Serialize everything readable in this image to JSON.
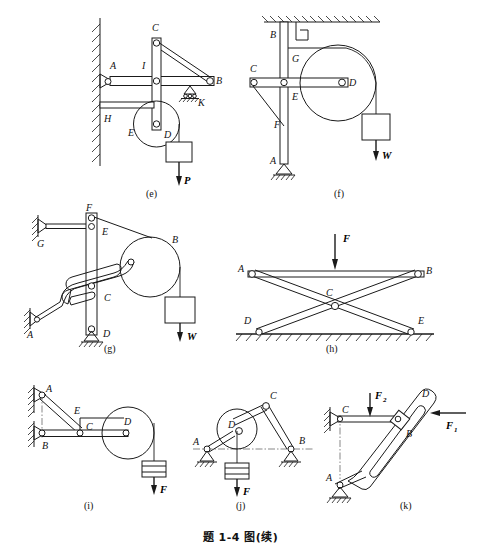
{
  "plate": {
    "caption": "题 1-4 图(续)",
    "figure_count": 7,
    "type": "engineering-mechanics-linkage-diagrams"
  },
  "subfigures": [
    {
      "id": "e",
      "label": "(e)",
      "description": "Wall-mounted bracket with pulley and hanging weight",
      "points": [
        "A",
        "B",
        "C",
        "D",
        "E",
        "H",
        "I",
        "K"
      ],
      "forces": [
        "P"
      ],
      "supports": [
        "wall-hatched",
        "roller-support"
      ],
      "point_labels": {
        "A": "A",
        "B": "B",
        "C": "C",
        "D": "D",
        "E": "E",
        "H": "H",
        "I": "I",
        "K": "K"
      },
      "force_labels": {
        "P": "P"
      }
    },
    {
      "id": "f",
      "label": "(f)",
      "description": "Ceiling-anchored vertical column with horizontal arm, drum pulley and weight",
      "points": [
        "A",
        "B",
        "C",
        "D",
        "E",
        "F",
        "G"
      ],
      "forces": [
        "W"
      ],
      "supports": [
        "ceiling-hatched",
        "pin-support-ground"
      ],
      "point_labels": {
        "A": "A",
        "B": "B",
        "C": "C",
        "D": "D",
        "E": "E",
        "F": "F",
        "G": "G"
      },
      "force_labels": {
        "W": "W"
      }
    },
    {
      "id": "g",
      "label": "(g)",
      "description": "Vertical link with slotted bar, pulley and hanging weight",
      "points": [
        "A",
        "B",
        "C",
        "D",
        "E",
        "F",
        "G"
      ],
      "forces": [
        "W"
      ],
      "supports": [
        "wall-hatched-G",
        "wall-hatched-A",
        "pin-support-ground-D"
      ],
      "point_labels": {
        "A": "A",
        "B": "B",
        "C": "C",
        "D": "D",
        "E": "E",
        "F": "F",
        "G": "G"
      },
      "force_labels": {
        "W": "W"
      }
    },
    {
      "id": "h",
      "label": "(h)",
      "description": "Scissor (X-shaped) linkage on ground with vertical load on top bar",
      "points": [
        "A",
        "B",
        "C",
        "D",
        "E"
      ],
      "forces": [
        "F"
      ],
      "supports": [
        "ground-hatched"
      ],
      "point_labels": {
        "A": "A",
        "B": "B",
        "C": "C",
        "D": "D",
        "E": "E"
      },
      "force_labels": {
        "F": "F"
      }
    },
    {
      "id": "i",
      "label": "(i)",
      "description": "Two wall pins with inclined brace, drum pulley and hanging load",
      "points": [
        "A",
        "B",
        "C",
        "D",
        "E"
      ],
      "forces": [
        "F"
      ],
      "supports": [
        "wall-hatched-A",
        "wall-hatched-B"
      ],
      "point_labels": {
        "A": "A",
        "B": "B",
        "C": "C",
        "D": "D",
        "E": "E"
      },
      "force_labels": {
        "F": "F"
      }
    },
    {
      "id": "j",
      "label": "(j)",
      "description": "Two-legged frame with pulley at D and hanging load on center line",
      "points": [
        "A",
        "B",
        "C",
        "D"
      ],
      "forces": [
        "F"
      ],
      "supports": [
        "pin-support-A",
        "pin-support-B"
      ],
      "point_labels": {
        "A": "A",
        "B": "B",
        "C": "C",
        "D": "D"
      },
      "force_labels": {
        "F": "F"
      }
    },
    {
      "id": "k",
      "label": "(k)",
      "description": "Inclined slotted link pinned at A with horizontal bar C, two applied forces",
      "points": [
        "A",
        "B",
        "C",
        "D"
      ],
      "forces": [
        "F1",
        "F2"
      ],
      "supports": [
        "wall-hatched-C",
        "pin-support-A"
      ],
      "point_labels": {
        "A": "A",
        "B": "B",
        "C": "C",
        "D": "D"
      },
      "force_labels": {
        "F1_base": "F",
        "F1_sub": "1",
        "F2_base": "F",
        "F2_sub": "2"
      }
    }
  ],
  "colors": {
    "ink": "#1a1a1a",
    "paper": "#ffffff",
    "centerline": "#555555"
  }
}
